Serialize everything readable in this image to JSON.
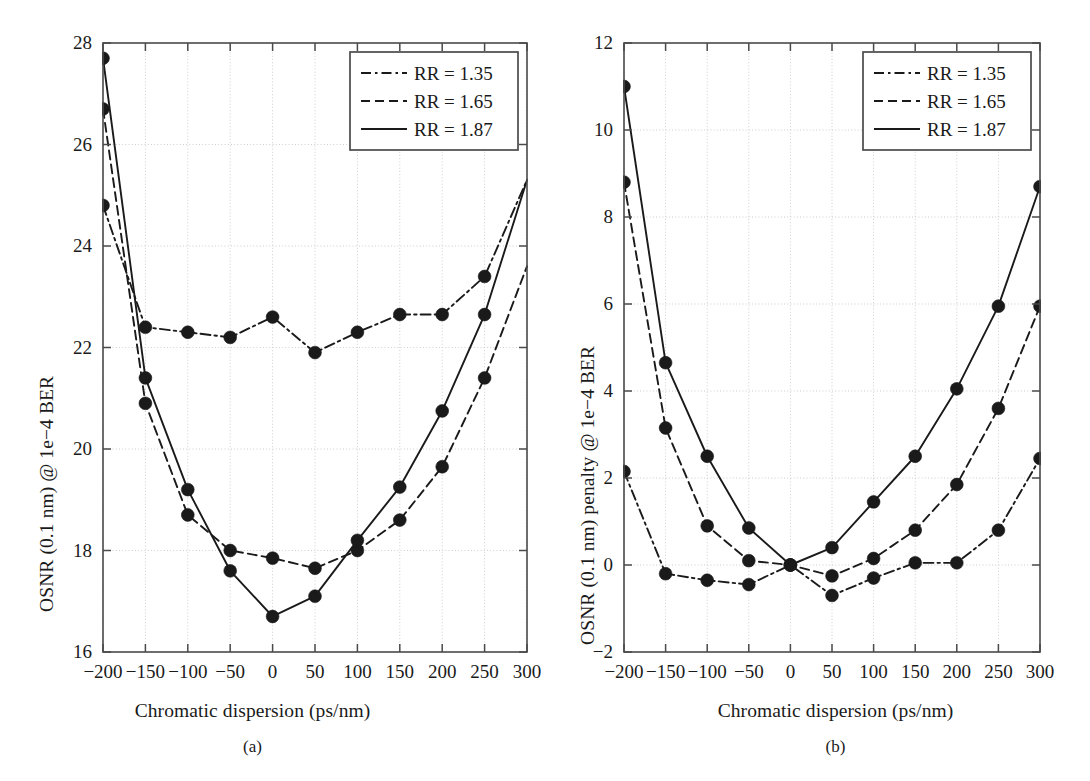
{
  "figure": {
    "panels": [
      {
        "id": "a",
        "subcaption": "(a)",
        "xlabel": "Chromatic dispersion (ps/nm)",
        "ylabel": "OSNR (0.1 nm) @ 1e−4 BER"
      },
      {
        "id": "b",
        "subcaption": "(b)",
        "xlabel": "Chromatic dispersion (ps/nm)",
        "ylabel": "OSNR (0.1 nm) penalty @ 1e−4 BER"
      }
    ],
    "legend": {
      "position": "top-right",
      "entries": [
        {
          "label": "RR = 1.35",
          "dash": "dash-dot"
        },
        {
          "label": "RR = 1.65",
          "dash": "dashed"
        },
        {
          "label": "RR = 1.87",
          "dash": "solid"
        }
      ]
    },
    "colors": {
      "line": "#1a1a1a",
      "marker": "#1a1a1a",
      "grid": "#c8c8c8",
      "frame": "#4a4a4a",
      "background": "#ffffff"
    }
  },
  "chart_data": [
    {
      "type": "line",
      "panel": "a",
      "title": "",
      "xlabel": "Chromatic dispersion (ps/nm)",
      "ylabel": "OSNR (0.1 nm) @ 1e-4 BER",
      "x": [
        -200,
        -150,
        -100,
        -50,
        0,
        50,
        100,
        150,
        200,
        250,
        300
      ],
      "xlim": [
        -200,
        300
      ],
      "ylim": [
        16,
        28
      ],
      "xticks": [
        -200,
        -150,
        -100,
        -50,
        0,
        50,
        100,
        150,
        200,
        250,
        300
      ],
      "yticks": [
        16,
        18,
        20,
        22,
        24,
        26,
        28
      ],
      "xtick_labels": [
        "−200",
        "−150",
        "−100",
        "−50",
        "0",
        "50",
        "100",
        "150",
        "200",
        "250",
        "300"
      ],
      "ytick_labels": [
        "16",
        "18",
        "20",
        "22",
        "24",
        "26",
        "28"
      ],
      "grid": true,
      "legend": "upper right",
      "series": [
        {
          "name": "RR = 1.35",
          "dash": "dash-dot",
          "values": [
            24.8,
            22.4,
            22.3,
            22.2,
            22.6,
            21.9,
            22.3,
            22.65,
            22.65,
            23.4,
            25.3
          ],
          "markers": [
            true,
            true,
            true,
            true,
            true,
            true,
            true,
            true,
            true,
            true,
            false
          ]
        },
        {
          "name": "RR = 1.65",
          "dash": "dashed",
          "values": [
            26.7,
            20.9,
            18.7,
            18.0,
            17.85,
            17.65,
            18.0,
            18.6,
            19.65,
            21.4,
            23.6
          ],
          "markers": [
            true,
            true,
            true,
            true,
            true,
            true,
            true,
            true,
            true,
            true,
            false
          ]
        },
        {
          "name": "RR = 1.87",
          "dash": "solid",
          "values": [
            27.7,
            21.4,
            19.2,
            17.6,
            16.7,
            17.1,
            18.2,
            19.25,
            20.75,
            22.65,
            25.3
          ],
          "markers": [
            true,
            true,
            true,
            true,
            true,
            true,
            true,
            true,
            true,
            true,
            false
          ]
        }
      ]
    },
    {
      "type": "line",
      "panel": "b",
      "title": "",
      "xlabel": "Chromatic dispersion (ps/nm)",
      "ylabel": "OSNR (0.1 nm) penalty @ 1e-4 BER",
      "x": [
        -200,
        -150,
        -100,
        -50,
        0,
        50,
        100,
        150,
        200,
        250,
        300
      ],
      "xlim": [
        -200,
        300
      ],
      "ylim": [
        -2,
        12
      ],
      "xticks": [
        -200,
        -150,
        -100,
        -50,
        0,
        50,
        100,
        150,
        200,
        250,
        300
      ],
      "yticks": [
        -2,
        0,
        2,
        4,
        6,
        8,
        10,
        12
      ],
      "xtick_labels": [
        "−200",
        "−150",
        "−100",
        "−50",
        "0",
        "50",
        "100",
        "150",
        "200",
        "250",
        "300"
      ],
      "ytick_labels": [
        "−2",
        "0",
        "2",
        "4",
        "6",
        "8",
        "10",
        "12"
      ],
      "grid": true,
      "legend": "upper right",
      "series": [
        {
          "name": "RR = 1.35",
          "dash": "dash-dot",
          "values": [
            2.15,
            -0.2,
            -0.35,
            -0.45,
            0.0,
            -0.7,
            -0.3,
            0.05,
            0.05,
            0.8,
            2.45
          ],
          "markers": [
            true,
            true,
            true,
            true,
            true,
            true,
            true,
            true,
            true,
            true,
            true
          ]
        },
        {
          "name": "RR = 1.65",
          "dash": "dashed",
          "values": [
            8.8,
            3.15,
            0.9,
            0.1,
            0.0,
            -0.25,
            0.15,
            0.8,
            1.85,
            3.6,
            5.95
          ],
          "markers": [
            true,
            true,
            true,
            true,
            true,
            true,
            true,
            true,
            true,
            true,
            true
          ]
        },
        {
          "name": "RR = 1.87",
          "dash": "solid",
          "values": [
            11.0,
            4.65,
            2.5,
            0.85,
            0.0,
            0.4,
            1.45,
            2.5,
            4.05,
            5.95,
            8.7
          ],
          "markers": [
            true,
            true,
            true,
            true,
            true,
            true,
            true,
            true,
            true,
            true,
            true
          ]
        }
      ]
    }
  ]
}
